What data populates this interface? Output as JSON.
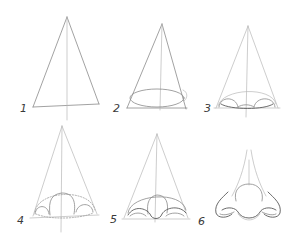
{
  "illustration": {
    "subject": "nose drawing tutorial",
    "style": "pencil sketch",
    "steps": [
      {
        "label": "1",
        "description": "triangle with center line"
      },
      {
        "label": "2",
        "description": "triangle with ellipse at base"
      },
      {
        "label": "3",
        "description": "triangle with ellipse and nostril arcs"
      },
      {
        "label": "4",
        "description": "refined ball of nose and nostril circles"
      },
      {
        "label": "5",
        "description": "nostril wings outlined"
      },
      {
        "label": "6",
        "description": "finished nose"
      }
    ]
  },
  "colors": {
    "background": "#ffffff",
    "pencil": "#8a8a8a",
    "pencil_light": "#b8b8b8",
    "pencil_dark": "#5a5a5a",
    "label": "#3a3a3a"
  }
}
